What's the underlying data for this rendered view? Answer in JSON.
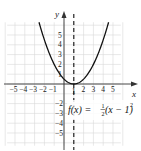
{
  "chart_data": {
    "type": "line",
    "title": "",
    "xlabel": "x",
    "ylabel": "y",
    "xlim": [
      -5.5,
      5.5
    ],
    "ylim": [
      -6,
      6
    ],
    "grid": true,
    "x_ticks": [
      "-5",
      "-4",
      "-3",
      "-2",
      "-1",
      "1",
      "2",
      "3",
      "4",
      "5"
    ],
    "y_ticks": [
      "5",
      "4",
      "3",
      "2",
      "1",
      "-1",
      "-2",
      "-3",
      "-4",
      "-5"
    ],
    "series": [
      {
        "name": "f(x) = 1/2(x - 1)^2",
        "function": "0.5*(x-1)^2",
        "x": [
          -2.5,
          -2,
          -1,
          0,
          1,
          2,
          3,
          4,
          4.5
        ],
        "y": [
          6.125,
          4.5,
          2,
          0.5,
          0,
          0.5,
          2,
          4.5,
          6.125
        ]
      }
    ],
    "annotations": [
      {
        "type": "dashed-vertical-line",
        "x": 1,
        "label": "axis of symmetry"
      },
      {
        "type": "text",
        "text": "f(x) = ½(x − 1)²",
        "position": [
          2.5,
          -2.5
        ]
      }
    ],
    "vertex": [
      1,
      0
    ]
  },
  "labels": {
    "x_axis": "x",
    "y_axis": "y",
    "equation_f": "f",
    "equation_paren_x": "(x) = ",
    "equation_num": "1",
    "equation_den": "2",
    "equation_rest": "(x − 1)",
    "equation_exp": "2"
  }
}
